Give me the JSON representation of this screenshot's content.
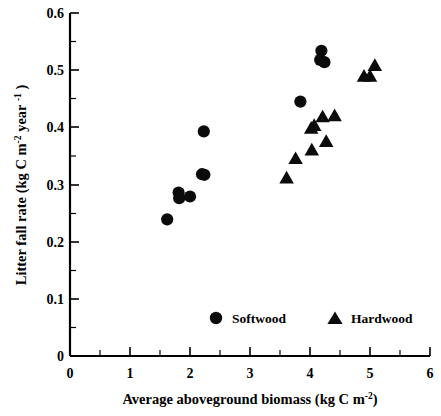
{
  "chart_data": {
    "type": "scatter",
    "title": "",
    "xlabel": "Average aboveground biomass (kg C m-2)",
    "ylabel": "Litter fall rate (kg C m-2 year -1)",
    "xlim": [
      0,
      6
    ],
    "ylim": [
      0,
      0.6
    ],
    "xticks": [
      0,
      1,
      2,
      3,
      4,
      5,
      6
    ],
    "xticklabels": [
      "0",
      "1",
      "2",
      "3",
      "4",
      "5",
      "6"
    ],
    "yticks": [
      0,
      0.1,
      0.2,
      0.3,
      0.4,
      0.5,
      0.6
    ],
    "yticklabels": [
      "0",
      "0.1",
      "0.2",
      "0.3",
      "0.4",
      "0.5",
      "0.6"
    ],
    "grid": false,
    "minor_ticks": true,
    "legend_position": "lower-center",
    "series": [
      {
        "name": "Softwood",
        "marker": "circle",
        "color": "#0b0b0b",
        "points": [
          {
            "x": 1.62,
            "y": 0.239
          },
          {
            "x": 1.81,
            "y": 0.286
          },
          {
            "x": 1.82,
            "y": 0.276
          },
          {
            "x": 2.0,
            "y": 0.279
          },
          {
            "x": 2.2,
            "y": 0.318
          },
          {
            "x": 2.24,
            "y": 0.317
          },
          {
            "x": 2.23,
            "y": 0.393
          },
          {
            "x": 3.84,
            "y": 0.445
          },
          {
            "x": 4.19,
            "y": 0.534
          },
          {
            "x": 4.17,
            "y": 0.518
          },
          {
            "x": 4.24,
            "y": 0.514
          }
        ]
      },
      {
        "name": "Hardwood",
        "marker": "triangle",
        "color": "#0b0b0b",
        "points": [
          {
            "x": 3.61,
            "y": 0.311
          },
          {
            "x": 3.76,
            "y": 0.345
          },
          {
            "x": 4.03,
            "y": 0.36
          },
          {
            "x": 4.02,
            "y": 0.398
          },
          {
            "x": 4.07,
            "y": 0.403
          },
          {
            "x": 4.27,
            "y": 0.375
          },
          {
            "x": 4.21,
            "y": 0.418
          },
          {
            "x": 4.41,
            "y": 0.42
          },
          {
            "x": 4.9,
            "y": 0.489
          },
          {
            "x": 5.0,
            "y": 0.489
          },
          {
            "x": 5.08,
            "y": 0.508
          }
        ]
      }
    ]
  },
  "legend": {
    "softwood_label": "Softwood",
    "hardwood_label": "Hardwood"
  },
  "axis": {
    "x_label_main": "Average aboveground biomass (kg C m",
    "x_label_sup": "-2",
    "x_label_end": ")",
    "y_label_p1": "Litter fall rate (kg C m",
    "y_label_sup1": "-2",
    "y_label_p2": " year ",
    "y_label_sup2": "-1",
    "y_label_p3": " )"
  }
}
